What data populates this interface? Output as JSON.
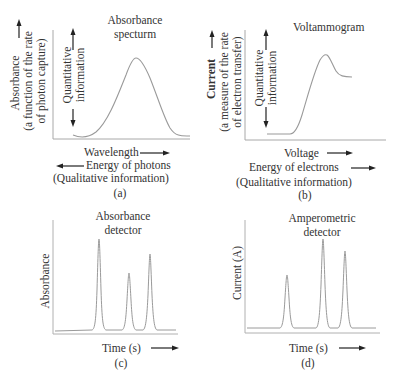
{
  "panels": {
    "a": {
      "title_line1": "Absorbance",
      "title_line2": "specturm",
      "ylabel_line1": "Absorbance",
      "ylabel_line2": "(a function of the rate",
      "ylabel_line3": "of photon capture)",
      "quant_line1": "Quantitative",
      "quant_line2": "information",
      "xlabel": "Wavelength",
      "energy_label": "Energy of photons",
      "qual_label": "(Qualitative information)",
      "caption": "(a)"
    },
    "b": {
      "title": "Voltammogram",
      "ylabel_bold": "Current",
      "ylabel_line2": "(a measure of the rate",
      "ylabel_line3": "of electron transfer)",
      "quant_line1": "Quantitative",
      "quant_line2": "information",
      "xlabel": "Voltage",
      "energy_label": "Energy of electrons",
      "qual_label": "(Qualitative information)",
      "caption": "(b)"
    },
    "c": {
      "title_line1": "Absorbance",
      "title_line2": "detector",
      "ylabel": "Absorbance",
      "xlabel": "Time (s)",
      "caption": "(c)"
    },
    "d": {
      "title_line1": "Amperometric",
      "title_line2": "detector",
      "ylabel": "Current (A)",
      "xlabel": "Time (s)",
      "caption": "(d)"
    }
  },
  "colors": {
    "curve": "#9a9a9a",
    "axis": "#a0a0a0",
    "arrow": "#222222",
    "text": "#333333"
  }
}
